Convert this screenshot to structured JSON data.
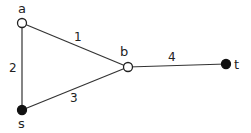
{
  "diagram": {
    "type": "weighted-graph",
    "nodes": [
      {
        "id": "a",
        "label": "a",
        "filled": false
      },
      {
        "id": "b",
        "label": "b",
        "filled": false
      },
      {
        "id": "s",
        "label": "s",
        "filled": true
      },
      {
        "id": "t",
        "label": "t",
        "filled": true
      }
    ],
    "edges": [
      {
        "from": "a",
        "to": "b",
        "weight": "1"
      },
      {
        "from": "a",
        "to": "s",
        "weight": "2"
      },
      {
        "from": "s",
        "to": "b",
        "weight": "3"
      },
      {
        "from": "b",
        "to": "t",
        "weight": "4"
      }
    ],
    "colors": {
      "edge": "#333333",
      "node_fill_dark": "#111111",
      "node_fill_light": "#ffffff"
    }
  }
}
